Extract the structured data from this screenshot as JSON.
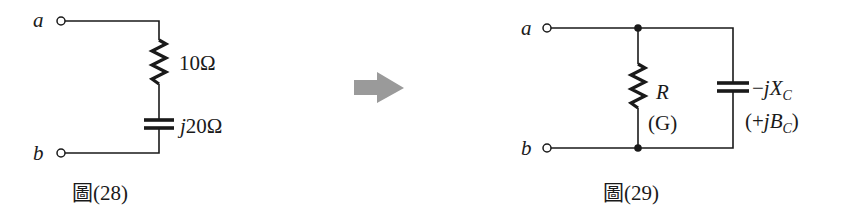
{
  "figure_28": {
    "caption": "圖(28)",
    "terminal_a": "a",
    "terminal_b": "b",
    "resistor_label": "10Ω",
    "capacitor_label_j": "j",
    "capacitor_label_value": "20Ω"
  },
  "arrow": {
    "icon": "right-arrow-icon",
    "color": "#9a9a9a"
  },
  "figure_29": {
    "caption": "圖(29)",
    "terminal_a": "a",
    "terminal_b": "b",
    "resistor_label": "R",
    "resistor_sublabel": "(G)",
    "capacitor_label_prefix": "−",
    "capacitor_label_j": "j",
    "capacitor_label_X": "X",
    "capacitor_label_X_sub": "C",
    "capacitor_sublabel_open": "(+",
    "capacitor_sublabel_j": "j",
    "capacitor_sublabel_B": "B",
    "capacitor_sublabel_B_sub": "C",
    "capacitor_sublabel_close": ")"
  },
  "colors": {
    "ink": "#1a1a1a",
    "background": "#ffffff",
    "arrow": "#9a9a9a"
  }
}
